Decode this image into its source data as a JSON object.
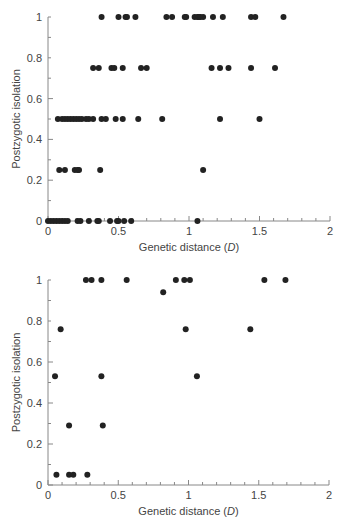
{
  "chart_data": [
    {
      "type": "scatter",
      "title": "",
      "xlabel": "Genetic distance (D)",
      "ylabel": "Postzygotic isolation",
      "xlim": [
        0,
        2
      ],
      "ylim": [
        0,
        1
      ],
      "xticks": [
        0,
        0.5,
        1,
        1.5,
        2
      ],
      "xtick_labels": [
        "0",
        "0.5",
        "1",
        "1.5",
        "2"
      ],
      "yticks": [
        0,
        0.2,
        0.4,
        0.6,
        0.8,
        1
      ],
      "ytick_labels": [
        "0",
        "0.2",
        "0.4",
        "0.6",
        "0.8",
        "1"
      ],
      "grid": false,
      "legend": null,
      "marker_color": "#222222",
      "points": [
        {
          "x": 0.38,
          "y": 1
        },
        {
          "x": 0.5,
          "y": 1
        },
        {
          "x": 0.55,
          "y": 1
        },
        {
          "x": 0.56,
          "y": 1
        },
        {
          "x": 0.62,
          "y": 1
        },
        {
          "x": 0.84,
          "y": 1
        },
        {
          "x": 0.88,
          "y": 1
        },
        {
          "x": 0.97,
          "y": 1
        },
        {
          "x": 0.98,
          "y": 1
        },
        {
          "x": 1.04,
          "y": 1
        },
        {
          "x": 1.06,
          "y": 1
        },
        {
          "x": 1.07,
          "y": 1
        },
        {
          "x": 1.08,
          "y": 1
        },
        {
          "x": 1.1,
          "y": 1
        },
        {
          "x": 1.17,
          "y": 1
        },
        {
          "x": 1.24,
          "y": 1
        },
        {
          "x": 1.44,
          "y": 1
        },
        {
          "x": 1.47,
          "y": 1
        },
        {
          "x": 1.67,
          "y": 1
        },
        {
          "x": 0.32,
          "y": 0.75
        },
        {
          "x": 0.36,
          "y": 0.75
        },
        {
          "x": 0.45,
          "y": 0.75
        },
        {
          "x": 0.47,
          "y": 0.75
        },
        {
          "x": 0.53,
          "y": 0.75
        },
        {
          "x": 0.66,
          "y": 0.75
        },
        {
          "x": 0.7,
          "y": 0.75
        },
        {
          "x": 1.16,
          "y": 0.75
        },
        {
          "x": 1.22,
          "y": 0.75
        },
        {
          "x": 1.28,
          "y": 0.75
        },
        {
          "x": 1.44,
          "y": 0.75
        },
        {
          "x": 1.61,
          "y": 0.75
        },
        {
          "x": 0.07,
          "y": 0.5
        },
        {
          "x": 0.1,
          "y": 0.5
        },
        {
          "x": 0.12,
          "y": 0.5
        },
        {
          "x": 0.14,
          "y": 0.5
        },
        {
          "x": 0.16,
          "y": 0.5
        },
        {
          "x": 0.18,
          "y": 0.5
        },
        {
          "x": 0.2,
          "y": 0.5
        },
        {
          "x": 0.22,
          "y": 0.5
        },
        {
          "x": 0.24,
          "y": 0.5
        },
        {
          "x": 0.27,
          "y": 0.5
        },
        {
          "x": 0.29,
          "y": 0.5
        },
        {
          "x": 0.32,
          "y": 0.5
        },
        {
          "x": 0.38,
          "y": 0.5
        },
        {
          "x": 0.41,
          "y": 0.5
        },
        {
          "x": 0.48,
          "y": 0.5
        },
        {
          "x": 0.53,
          "y": 0.5
        },
        {
          "x": 0.64,
          "y": 0.5
        },
        {
          "x": 0.81,
          "y": 0.5
        },
        {
          "x": 1.22,
          "y": 0.5
        },
        {
          "x": 1.5,
          "y": 0.5
        },
        {
          "x": 0.08,
          "y": 0.25
        },
        {
          "x": 0.12,
          "y": 0.25
        },
        {
          "x": 0.19,
          "y": 0.25
        },
        {
          "x": 0.21,
          "y": 0.25
        },
        {
          "x": 0.22,
          "y": 0.25
        },
        {
          "x": 0.37,
          "y": 0.25
        },
        {
          "x": 1.1,
          "y": 0.25
        },
        {
          "x": 0.0,
          "y": 0
        },
        {
          "x": 0.02,
          "y": 0
        },
        {
          "x": 0.04,
          "y": 0
        },
        {
          "x": 0.06,
          "y": 0
        },
        {
          "x": 0.08,
          "y": 0
        },
        {
          "x": 0.1,
          "y": 0
        },
        {
          "x": 0.12,
          "y": 0
        },
        {
          "x": 0.14,
          "y": 0
        },
        {
          "x": 0.21,
          "y": 0
        },
        {
          "x": 0.23,
          "y": 0
        },
        {
          "x": 0.29,
          "y": 0
        },
        {
          "x": 0.35,
          "y": 0
        },
        {
          "x": 0.36,
          "y": 0
        },
        {
          "x": 0.44,
          "y": 0
        },
        {
          "x": 0.49,
          "y": 0
        },
        {
          "x": 0.5,
          "y": 0
        },
        {
          "x": 0.54,
          "y": 0
        },
        {
          "x": 0.59,
          "y": 0
        },
        {
          "x": 1.06,
          "y": 0
        }
      ]
    },
    {
      "type": "scatter",
      "title": "",
      "xlabel": "Genetic distance (D)",
      "ylabel": "Postzygotic isolation",
      "xlim": [
        0,
        2
      ],
      "ylim": [
        0,
        1
      ],
      "xticks": [
        0,
        0.5,
        1,
        1.5,
        2
      ],
      "xtick_labels": [
        "0",
        "0.5",
        "1",
        "1.5",
        "2"
      ],
      "yticks": [
        0,
        0.2,
        0.4,
        0.6,
        0.8,
        1
      ],
      "ytick_labels": [
        "0",
        "0.2",
        "0.4",
        "0.6",
        "0.8",
        "1"
      ],
      "grid": false,
      "legend": null,
      "marker_color": "#222222",
      "points": [
        {
          "x": 0.27,
          "y": 1
        },
        {
          "x": 0.31,
          "y": 1
        },
        {
          "x": 0.38,
          "y": 1
        },
        {
          "x": 0.56,
          "y": 1
        },
        {
          "x": 0.91,
          "y": 1
        },
        {
          "x": 0.97,
          "y": 1
        },
        {
          "x": 1.01,
          "y": 1
        },
        {
          "x": 1.54,
          "y": 1
        },
        {
          "x": 1.69,
          "y": 1
        },
        {
          "x": 0.82,
          "y": 0.94
        },
        {
          "x": 0.09,
          "y": 0.76
        },
        {
          "x": 0.98,
          "y": 0.76
        },
        {
          "x": 1.44,
          "y": 0.76
        },
        {
          "x": 0.05,
          "y": 0.53
        },
        {
          "x": 0.38,
          "y": 0.53
        },
        {
          "x": 1.06,
          "y": 0.53
        },
        {
          "x": 0.15,
          "y": 0.29
        },
        {
          "x": 0.39,
          "y": 0.29
        },
        {
          "x": 0.06,
          "y": 0.05
        },
        {
          "x": 0.15,
          "y": 0.05
        },
        {
          "x": 0.18,
          "y": 0.05
        },
        {
          "x": 0.28,
          "y": 0.05
        }
      ]
    }
  ],
  "panels": [
    {
      "xlabel_main": "Genetic distance (",
      "xlabel_var": "D",
      "xlabel_end": ")",
      "ylabel": "Postzygotic isolation"
    },
    {
      "xlabel_main": "Genetic distance (",
      "xlabel_var": "D",
      "xlabel_end": ")",
      "ylabel": "Postzygotic isolation"
    }
  ]
}
